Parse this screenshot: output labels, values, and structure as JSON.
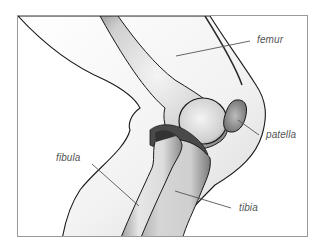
{
  "diagram": {
    "labels": [
      {
        "id": "femur",
        "text": "femur"
      },
      {
        "id": "patella",
        "text": "patella"
      },
      {
        "id": "fibula",
        "text": "fibula"
      },
      {
        "id": "tibia",
        "text": "tibia"
      }
    ],
    "colors": {
      "outline": "#1a1a1a",
      "leader_line": "#555555",
      "label_text": "#555555",
      "frame_border": "#9a9a9a",
      "background": "#ffffff"
    }
  }
}
